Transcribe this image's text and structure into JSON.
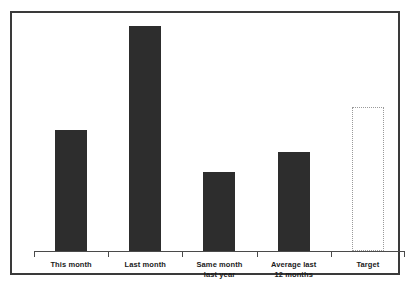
{
  "chart_data": {
    "type": "bar",
    "title": "",
    "subtitle": "",
    "xlabel": "",
    "ylabel": "",
    "categories": [
      "This month",
      "Last month",
      "Same month\nlast year",
      "Average last\n12 months",
      "Target"
    ],
    "values": [
      54,
      100,
      35,
      44,
      64
    ],
    "ylim": [
      0,
      100
    ],
    "grid": false,
    "legend": null,
    "annotations": [],
    "bar_styles": [
      "filled",
      "filled",
      "filled",
      "filled",
      "dotted-outline"
    ],
    "colors": {
      "bar_fill": "#2d2d2d",
      "target_outline": "#9a9a9a",
      "axis": "#4a4a4a",
      "frame": "#3a3a3a",
      "label_text": "#1a1a1a",
      "background": "#ffffff"
    }
  }
}
